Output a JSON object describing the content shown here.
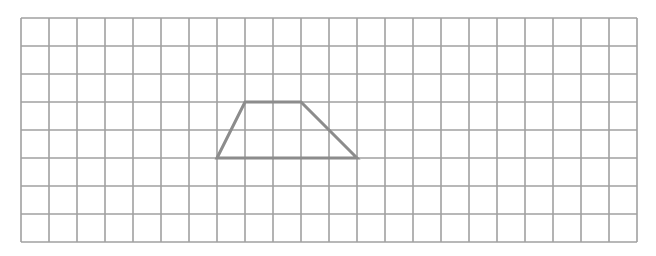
{
  "grid": {
    "origin_x": 21,
    "origin_y": 18,
    "cell_size": 28,
    "columns": 22,
    "rows": 8,
    "line_color": "#a0a0a0",
    "line_width": 1.6
  },
  "shape": {
    "name": "trapezoid",
    "stroke_color": "#8c8c8c",
    "stroke_width": 3,
    "vertices_grid": [
      [
        7,
        5
      ],
      [
        8,
        3
      ],
      [
        10,
        3
      ],
      [
        12,
        5
      ]
    ]
  }
}
